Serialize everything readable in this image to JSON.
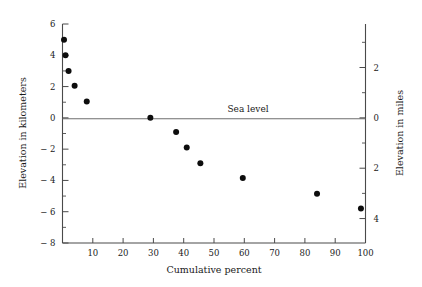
{
  "figure": {
    "annotation": "Sea level",
    "background": "#ffffff",
    "point_color": "#0d0d0d",
    "axis_color": "#4a4a4a",
    "sea_level_color": "#6e6e6e"
  },
  "chart_data": {
    "type": "scatter",
    "title": "",
    "xlabel": "Cumulative percent",
    "ylabel": "Elevation in kilometers",
    "y2label": "Elevation in miles",
    "xlim": [
      0,
      100
    ],
    "ylim": [
      -8,
      6
    ],
    "y2lim": [
      -4.971,
      3.728
    ],
    "grid": false,
    "legend": null,
    "xticks": [
      0,
      10,
      20,
      30,
      40,
      50,
      60,
      70,
      80,
      90,
      100
    ],
    "xticklabels": [
      "",
      "10",
      "20",
      "30",
      "40",
      "50",
      "60",
      "70",
      "80",
      "90",
      "100"
    ],
    "yticks": [
      -8,
      -6,
      -4,
      -2,
      0,
      2,
      4,
      6
    ],
    "yticklabels": [
      "− 8",
      "− 6",
      "− 4",
      "− 2",
      "0",
      "2",
      "4",
      "6"
    ],
    "yticks_minor": [
      -7,
      -5,
      -3,
      -1,
      1,
      3,
      5
    ],
    "y2ticks": [
      -4,
      -2,
      0,
      2
    ],
    "y2ticklabels": [
      "4",
      "2",
      "0",
      "2"
    ],
    "y2ticks_minor": [
      -3,
      -1,
      1,
      3
    ],
    "annotations": [
      {
        "text": "Sea level",
        "x": 48,
        "y": 0.55
      }
    ],
    "reference_lines": [
      {
        "axis": "y",
        "value": 0,
        "label": "Sea level"
      }
    ],
    "series": [
      {
        "name": "Hypsometric curve",
        "x": [
          0.5,
          1.0,
          2.0,
          4.0,
          8.0,
          29.0,
          37.5,
          41.0,
          45.5,
          59.5,
          84.0,
          98.5
        ],
        "y": [
          5.0,
          4.0,
          3.0,
          2.05,
          1.05,
          0.0,
          -0.9,
          -1.9,
          -2.9,
          -3.85,
          -4.85,
          -5.8
        ]
      }
    ]
  }
}
